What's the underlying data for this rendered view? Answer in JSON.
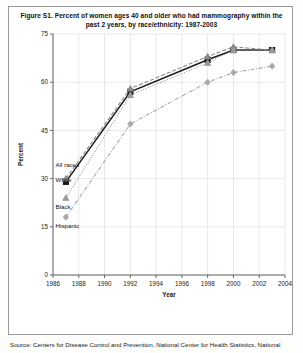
{
  "figure": {
    "title": "Figure S1. Percent of women ages 40 and older who had mammography within the past 2 years, by race/ethnicity: 1987-2003",
    "source_note": "Source: Centers for Disease Control and Prevention, National Center for Health Statistics, National"
  },
  "chart_data": {
    "type": "line",
    "title": "Figure S1. Percent of women ages 40 and older who had mammography within the past 2 years, by race/ethnicity: 1987-2003",
    "xlabel": "Year",
    "ylabel": "Percent",
    "xlim": [
      1986,
      2004
    ],
    "ylim": [
      0,
      75
    ],
    "xticks": [
      1986,
      1988,
      1990,
      1992,
      1994,
      1996,
      1998,
      2000,
      2002,
      2004
    ],
    "yticks": [
      0,
      15,
      30,
      45,
      60,
      75
    ],
    "grid": true,
    "legend": "in-plot labels at left",
    "x": [
      1987,
      1992,
      1998,
      2000,
      2003
    ],
    "series": [
      {
        "name": "All races",
        "values": [
          29,
          57,
          67,
          70,
          70
        ],
        "color": "#1a1a1a",
        "marker": "square",
        "dash": "solid"
      },
      {
        "name": "White",
        "values": [
          30,
          58,
          68,
          71,
          70
        ],
        "color": "#8a8a8a",
        "marker": "triangle",
        "dash": "dashed"
      },
      {
        "name": "Black",
        "values": [
          24,
          56,
          66,
          70,
          70
        ],
        "color": "#9a9a9a",
        "marker": "triangle",
        "dash": "dotted"
      },
      {
        "name": "Hispanic",
        "values": [
          18,
          47,
          60,
          63,
          65
        ],
        "color": "#a8a8a8",
        "marker": "diamond",
        "dash": "dashdot"
      }
    ],
    "annotations": [
      {
        "text": "All races",
        "x": 1986.2,
        "y": 33.5
      },
      {
        "text": "White",
        "x": 1986.2,
        "y": 29.0
      },
      {
        "text": "Black",
        "x": 1986.2,
        "y": 20.5
      },
      {
        "text": "Hispanic",
        "x": 1986.2,
        "y": 14.5
      }
    ]
  },
  "axis": {
    "yticks": [
      "0",
      "15",
      "30",
      "45",
      "60",
      "75"
    ],
    "xticks": [
      "1986",
      "1988",
      "1990",
      "1992",
      "1994",
      "1996",
      "1998",
      "2000",
      "2002",
      "2004"
    ],
    "ylabel": "Percent",
    "xlabel": "Year"
  },
  "series_labels": {
    "all_races": "All races",
    "white": "White",
    "black": "Black",
    "hispanic": "Hispanic"
  }
}
